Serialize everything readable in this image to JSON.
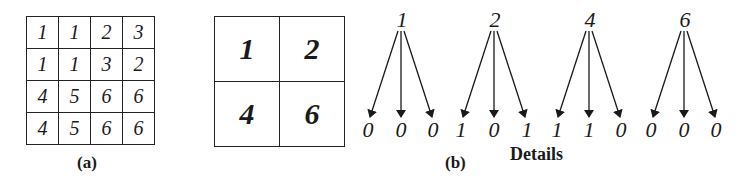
{
  "figure": {
    "panel_a": {
      "label": "(a)",
      "grid": [
        [
          "1",
          "1",
          "2",
          "3"
        ],
        [
          "1",
          "1",
          "3",
          "2"
        ],
        [
          "4",
          "5",
          "6",
          "6"
        ],
        [
          "4",
          "5",
          "6",
          "6"
        ]
      ]
    },
    "panel_b_grid": {
      "grid": [
        [
          "1",
          "2"
        ],
        [
          "4",
          "6"
        ]
      ]
    },
    "panel_b": {
      "label": "(b)",
      "caption": "Details",
      "trees": [
        {
          "root": "1",
          "children": [
            "0",
            "0",
            "0"
          ]
        },
        {
          "root": "2",
          "children": [
            "1",
            "0",
            "1"
          ]
        },
        {
          "root": "4",
          "children": [
            "1",
            "1",
            "0"
          ]
        },
        {
          "root": "6",
          "children": [
            "0",
            "0",
            "0"
          ]
        }
      ]
    }
  }
}
